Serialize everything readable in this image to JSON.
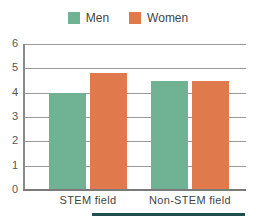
{
  "chart_data": {
    "type": "bar",
    "title": "",
    "xlabel": "",
    "ylabel": "",
    "categories": [
      "STEM field",
      "Non-STEM field"
    ],
    "series": [
      {
        "name": "Men",
        "color": "#6fb394",
        "values": [
          4.0,
          4.5
        ]
      },
      {
        "name": "Women",
        "color": "#e07a4c",
        "values": [
          4.8,
          4.5
        ]
      }
    ],
    "ylim": [
      0,
      6
    ],
    "yticks": [
      "0",
      "1",
      "2",
      "3",
      "4",
      "5",
      "6"
    ],
    "grid": true,
    "legend_position": "top"
  },
  "legend": {
    "items": [
      {
        "label": "Men",
        "color": "#6fb394"
      },
      {
        "label": "Women",
        "color": "#e07a4c"
      }
    ]
  },
  "accent_strip_color": "#1f4f4c"
}
